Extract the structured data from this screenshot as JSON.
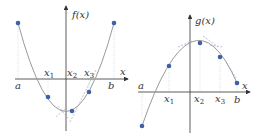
{
  "colors": {
    "axis": "#333333",
    "curve": "#9a9a9a",
    "point": "#3f5fa8",
    "guide": "#c8c8c8",
    "tangent": "#8a9ac8"
  },
  "left_panel": {
    "ylabel": "f(x)",
    "xlabel": "x",
    "labels": {
      "a": "a",
      "b": "b",
      "x1": "x",
      "x1_sub": "1",
      "x2": "x",
      "x2_sub": "2",
      "x3": "x",
      "x3_sub": "3"
    },
    "points": [
      [
        18,
        23
      ],
      [
        48,
        97
      ],
      [
        72,
        111
      ],
      [
        89,
        92
      ],
      [
        114,
        23
      ]
    ],
    "curve_path": "M18,23 Q66,200 114,23"
  },
  "right_panel": {
    "ylabel": "g(x)",
    "xlabel": "x",
    "labels": {
      "a": "a",
      "b": "b",
      "x1": "x",
      "x1_sub": "1",
      "x2": "x",
      "x2_sub": "2",
      "x3": "x",
      "x3_sub": "3"
    },
    "points": [
      [
        142,
        126
      ],
      [
        169,
        66
      ],
      [
        200,
        43
      ],
      [
        220,
        57
      ],
      [
        237,
        83
      ]
    ],
    "curve_path": "M142,126 Q192,-20 237,83"
  }
}
